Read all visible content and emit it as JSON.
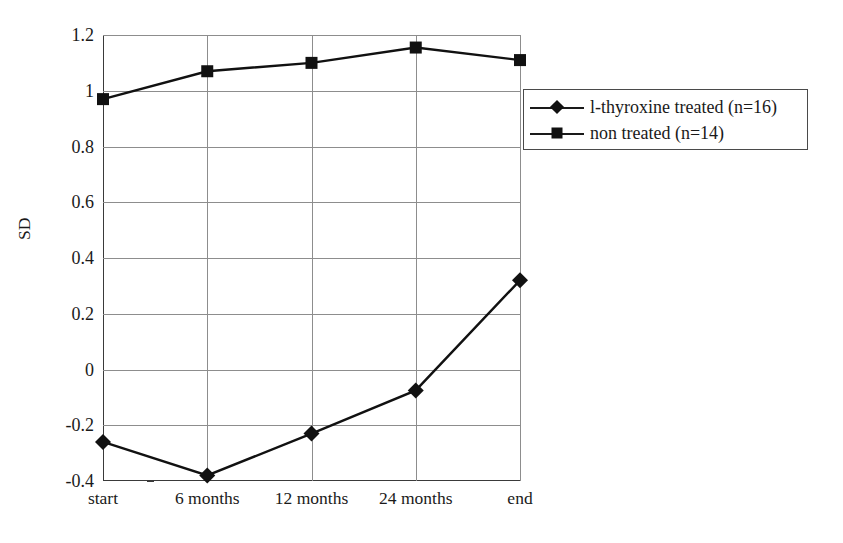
{
  "chart_data": {
    "type": "line",
    "title": "",
    "xlabel": "",
    "ylabel": "SD",
    "categories": [
      "start",
      "6 months",
      "12 months",
      "24 months",
      "end"
    ],
    "ylim": [
      -0.4,
      1.2
    ],
    "yticks": [
      "-0.4",
      "-0.2",
      "0",
      "0.2",
      "0.4",
      "0.6",
      "0.8",
      "1",
      "1.2"
    ],
    "ytick_values": [
      -0.4,
      -0.2,
      0,
      0.2,
      0.4,
      0.6,
      0.8,
      1,
      1.2
    ],
    "grid": "horizontal-and-vertical",
    "legend_position": "upper-right-inside",
    "series": [
      {
        "name": "l-thyroxine treated (n=16)",
        "marker": "diamond",
        "color": "#111111",
        "values": [
          -0.26,
          -0.38,
          -0.23,
          -0.075,
          0.32
        ]
      },
      {
        "name": "non treated (n=14)",
        "marker": "square",
        "color": "#111111",
        "values": [
          0.97,
          1.07,
          1.1,
          1.155,
          1.11
        ]
      }
    ]
  },
  "legend": {
    "items": [
      {
        "label": "l-thyroxine treated (n=16)",
        "marker": "diamond"
      },
      {
        "label": "non treated (n=14)",
        "marker": "square"
      }
    ]
  }
}
